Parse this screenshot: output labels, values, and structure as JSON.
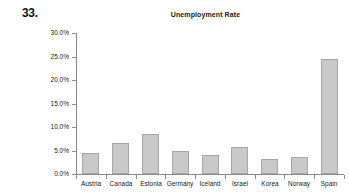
{
  "problem": {
    "number": "33."
  },
  "chart_data": {
    "type": "bar",
    "title": "Unemployment Rate",
    "xlabel": "",
    "ylabel": "",
    "categories": [
      "Austria",
      "Canada",
      "Estonia",
      "Germany",
      "Iceland",
      "Israel",
      "Korea",
      "Norway",
      "Spain"
    ],
    "values": [
      4.5,
      6.5,
      8.5,
      4.9,
      4.1,
      5.8,
      3.1,
      3.6,
      24.5
    ],
    "value_labels": [
      "4.5%",
      "6.5%",
      "8.5%",
      "4.9%",
      "4.1%",
      "5.8%",
      "3.1%",
      "3.6%",
      "24.5%"
    ],
    "ylim": [
      0,
      30
    ],
    "ytick_values": [
      0,
      5,
      10,
      15,
      20,
      25,
      30
    ],
    "ytick_labels": [
      "0.0%",
      "5.0%",
      "10.0%",
      "15.0%",
      "20.0%",
      "25.0%",
      "30.0%"
    ],
    "grid": false,
    "legend": false,
    "legend_position": "none",
    "bar_color": "#c9c9c9",
    "bar_border_color": "#a6a6a6",
    "axis_color": "#8a8a8a",
    "text_color": "#1a1a1a"
  }
}
